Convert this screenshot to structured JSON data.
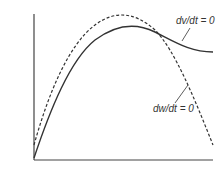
{
  "diagram": {
    "type": "nullcline-plot",
    "curves": [
      {
        "name": "dv-dt-nullcline",
        "style": "solid",
        "label": "dv/dt = 0"
      },
      {
        "name": "dw-dt-nullcline",
        "style": "dashed",
        "label": "dw/dt = 0"
      }
    ]
  },
  "labels": {
    "dv": "dv/dt = 0",
    "dw": "dw/dt = 0"
  },
  "colors": {
    "line": "#333333",
    "background": "#ffffff"
  }
}
